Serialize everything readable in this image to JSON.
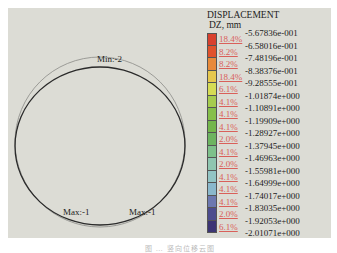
{
  "chart_data": {
    "type": "heatmap",
    "title": "DISPLACEMENT",
    "subtitle": "DZ, mm",
    "plot": {
      "shape": "ring deformation (deformed vs. undeformed circle)",
      "annotations": [
        {
          "text": "Min:-2",
          "position": "top"
        },
        {
          "text": "Max:-1",
          "position": "bottom-left"
        },
        {
          "text": "Max:-1",
          "position": "bottom-right"
        }
      ]
    },
    "legend": {
      "position": "right",
      "levels": [
        "-5.67836e-001",
        "-6.58016e-001",
        "-7.48196e-001",
        "-8.38376e-001",
        "-9.28555e-001",
        "-1.01874e+000",
        "-1.10891e+000",
        "-1.19909e+000",
        "-1.28927e+000",
        "-1.37945e+000",
        "-1.46963e+000",
        "-1.55981e+000",
        "-1.64999e+000",
        "-1.74017e+000",
        "-1.83035e+000",
        "-1.92053e+000",
        "-2.01071e+000"
      ],
      "bins": [
        {
          "percent": "18.4%",
          "color": "#d8402e"
        },
        {
          "percent": "8.2%",
          "color": "#e0522c"
        },
        {
          "percent": "8.2%",
          "color": "#e88a3a"
        },
        {
          "percent": "18.4%",
          "color": "#e6c84e"
        },
        {
          "percent": "6.1%",
          "color": "#d6dc54"
        },
        {
          "percent": "4.1%",
          "color": "#a6cc4e"
        },
        {
          "percent": "4.1%",
          "color": "#86bf4a"
        },
        {
          "percent": "4.1%",
          "color": "#74b64c"
        },
        {
          "percent": "2.0%",
          "color": "#6db460"
        },
        {
          "percent": "4.1%",
          "color": "#7ec08a"
        },
        {
          "percent": "2.0%",
          "color": "#8fc6b0"
        },
        {
          "percent": "4.1%",
          "color": "#92c4c4"
        },
        {
          "percent": "4.1%",
          "color": "#8ab8cc"
        },
        {
          "percent": "4.1%",
          "color": "#6c78b0"
        },
        {
          "percent": "2.0%",
          "color": "#4c4c8e"
        },
        {
          "percent": "6.1%",
          "color": "#3c3574"
        }
      ]
    }
  },
  "labels": {
    "min": "Min:-2",
    "max_left": "Max:-1",
    "max_right": "Max:-1"
  },
  "caption": "图 … 竖向位移云图"
}
